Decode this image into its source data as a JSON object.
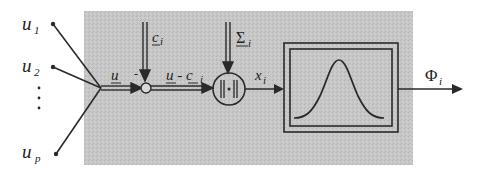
{
  "diagram": {
    "colors": {
      "panel": "#c4c4c4",
      "line": "#2a2a2a",
      "background": "#ffffff"
    },
    "inputs": [
      {
        "label": "u",
        "sub": "1"
      },
      {
        "label": "u",
        "sub": "2"
      },
      {
        "label": "⋮",
        "sub": ""
      },
      {
        "label": "u",
        "sub": "p"
      }
    ],
    "signals": {
      "input_vector": "u",
      "center": {
        "label": "c",
        "sub": "i"
      },
      "difference": {
        "label": "u - c",
        "sub": "i"
      },
      "covariance": {
        "label": "Σ",
        "sub": "i"
      },
      "distance": {
        "label": "x",
        "sub": "i"
      },
      "output": {
        "label": "Φ",
        "sub": "i"
      }
    },
    "nodes": {
      "summing_sign": "-",
      "norm_symbol": "||·||",
      "activation": "gaussian"
    }
  }
}
